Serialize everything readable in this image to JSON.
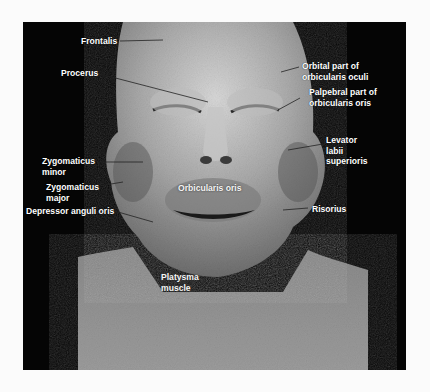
{
  "figure": {
    "background_color": "#050505",
    "page_color": "#fbfbfb",
    "labels": {
      "frontalis": "Frontalis",
      "procerus": "Procerus",
      "orbital_part_line1": "Orbital part of",
      "orbital_part_line2": "orbicularis oculi",
      "palpebral_part_line1": "Palpebral part of",
      "palpebral_part_line2": "orbicularis oris",
      "levator_line1": "Levator",
      "levator_line2": "labii",
      "levator_line3": "superioris",
      "zygomaticus_minor_line1": "Zygomaticus",
      "zygomaticus_minor_line2": "minor",
      "zygomaticus_major_line1": "Zygomaticus",
      "zygomaticus_major_line2": "major",
      "orbicularis_oris": "Orbicularis oris",
      "depressor_anguli_oris": "Depressor anguli oris",
      "risorius": "Risorius",
      "platysma_line1": "Platysma",
      "platysma_line2": "muscle"
    }
  }
}
